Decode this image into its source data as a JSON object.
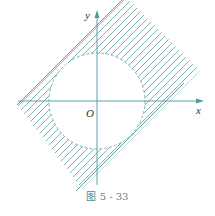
{
  "figure": {
    "caption": "图 5 - 33",
    "axis_x_label": "x",
    "axis_y_label": "y",
    "origin_label": "O",
    "colors": {
      "axis": "#4a9aa6",
      "hatch": "#5f9ea6",
      "circle": "#7aa8ad",
      "caption": "#3f8e9a"
    }
  }
}
